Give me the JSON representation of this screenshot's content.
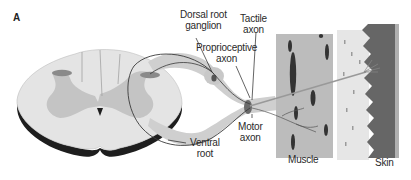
{
  "figure": {
    "panel_label": "A",
    "labels": {
      "dorsal_root_ganglion": [
        "Dorsal root",
        "ganglion"
      ],
      "tactile_axon": [
        "Tactile",
        "axon"
      ],
      "proprioceptive_axon": [
        "Proprioceptive",
        "axon"
      ],
      "motor_axon": [
        "Motor",
        "axon"
      ],
      "ventral_root": [
        "Ventral",
        "root"
      ],
      "muscle": "Muscle",
      "skin": "Skin"
    },
    "colors": {
      "cord_white_matter": "#e4e4e4",
      "cord_gray_matter": "#c4c4c4",
      "cord_edge": "#1e1e1e",
      "nerve_root": "#cfcfcf",
      "muscle": "#bcbcbc",
      "muscle_nuclei": "#3a3a3a",
      "dermis": "#e6e6e6",
      "epidermis": "#666666",
      "axon_line": "#222222"
    }
  }
}
